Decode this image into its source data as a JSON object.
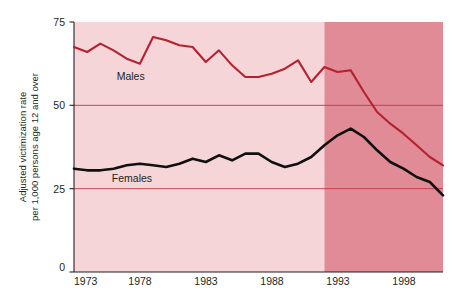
{
  "chart_data": {
    "type": "line",
    "title": "",
    "xlabel": "",
    "ylabel": "Adjusted victimization rate per 1,000 persons age 12 and over",
    "ylabel_line1": "Adjusted victimization rate",
    "ylabel_line2": "per 1,000 persons age 12 and over",
    "xlim": [
      1973,
      2001
    ],
    "ylim": [
      0,
      75
    ],
    "ytick_values": [
      0,
      25,
      50,
      75
    ],
    "ytick_labels": [
      "0",
      "25",
      "50",
      "75"
    ],
    "xtick_values": [
      1973,
      1978,
      1983,
      1988,
      1993,
      1998
    ],
    "xtick_labels": [
      "1973",
      "1978",
      "1983",
      "1988",
      "1993",
      "1998"
    ],
    "gridlines": {
      "horizontal_at": [
        25,
        50
      ],
      "vertical": false
    },
    "legend": {
      "position": "inline-annotation",
      "entries": [
        "Males",
        "Females"
      ]
    },
    "shaded_regions": [
      {
        "name": "light-band",
        "from": 1973,
        "to": 1992,
        "color": "#f6d5d8"
      },
      {
        "name": "dark-band",
        "from": 1992,
        "to": 2001,
        "color": "#e08b95"
      }
    ],
    "x": [
      1973,
      1974,
      1975,
      1976,
      1977,
      1978,
      1979,
      1980,
      1981,
      1982,
      1983,
      1984,
      1985,
      1986,
      1987,
      1988,
      1989,
      1990,
      1991,
      1992,
      1993,
      1994,
      1995,
      1996,
      1997,
      1998,
      1999,
      2000,
      2001
    ],
    "series": [
      {
        "name": "Males",
        "color": "#b5212f",
        "label": "Males",
        "label_x": 1977.3,
        "label_y": 57.5,
        "values": [
          67.5,
          66.0,
          68.5,
          66.5,
          64.0,
          62.5,
          70.5,
          69.5,
          68.0,
          67.5,
          63.0,
          66.5,
          62.0,
          58.5,
          58.5,
          59.5,
          61.0,
          63.5,
          57.0,
          61.5,
          60.0,
          60.5,
          54.0,
          48.0,
          44.5,
          41.5,
          38.0,
          34.5,
          32.0
        ]
      },
      {
        "name": "Females",
        "color": "#101010",
        "label": "Females",
        "label_x": 1977.4,
        "label_y": 27.0,
        "values": [
          31.0,
          30.5,
          30.5,
          31.0,
          32.0,
          32.5,
          32.0,
          31.5,
          32.5,
          34.0,
          33.0,
          35.0,
          33.5,
          35.5,
          35.5,
          33.0,
          31.5,
          32.5,
          34.5,
          38.0,
          41.0,
          43.0,
          40.5,
          36.5,
          33.0,
          31.0,
          28.5,
          27.0,
          23.0
        ]
      }
    ]
  },
  "axis": {
    "y_axis_line_color": "#231f20",
    "x_axis_line_color": "#231f20"
  }
}
